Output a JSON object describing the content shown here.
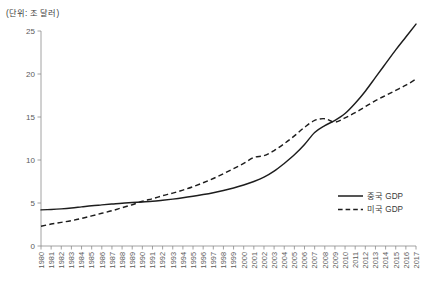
{
  "chart_data": {
    "type": "line",
    "title": "(단위: 조 달러)",
    "xlabel": "",
    "ylabel": "",
    "ylim": [
      0,
      25
    ],
    "yticks": [
      0,
      5,
      10,
      15,
      20,
      25
    ],
    "grid": false,
    "legend_position": "bottom-right",
    "x": [
      1980,
      1981,
      1982,
      1983,
      1984,
      1985,
      1986,
      1987,
      1988,
      1989,
      1990,
      1991,
      1992,
      1993,
      1994,
      1995,
      1996,
      1997,
      1998,
      1999,
      2000,
      2001,
      2002,
      2003,
      2004,
      2005,
      2006,
      2007,
      2008,
      2009,
      2010,
      2011,
      2012,
      2013,
      2014,
      2015,
      2016,
      2017
    ],
    "categories": [
      "1980",
      "1981",
      "1982",
      "1983",
      "1984",
      "1985",
      "1986",
      "1987",
      "1988",
      "1989",
      "1990",
      "1991",
      "1992",
      "1993",
      "1994",
      "1995",
      "1996",
      "1997",
      "1998",
      "1999",
      "2000",
      "2001",
      "2002",
      "2003",
      "2004",
      "2005",
      "2006",
      "2007",
      "2008",
      "2009",
      "2010",
      "2011",
      "2012",
      "2013",
      "2014",
      "2015",
      "2016",
      "2017"
    ],
    "series": [
      {
        "name": "중국 GDP",
        "style": "solid",
        "color": "#1d1d1d",
        "values": [
          4.2,
          4.25,
          4.32,
          4.42,
          4.55,
          4.68,
          4.78,
          4.88,
          4.98,
          5.05,
          5.12,
          5.2,
          5.32,
          5.45,
          5.6,
          5.78,
          5.98,
          6.2,
          6.45,
          6.75,
          7.1,
          7.5,
          8.0,
          8.7,
          9.6,
          10.6,
          11.8,
          13.2,
          14.0,
          14.6,
          15.4,
          16.6,
          18.0,
          19.6,
          21.2,
          22.8,
          24.3,
          25.8
        ]
      },
      {
        "name": "미국 GDP",
        "style": "dashed",
        "color": "#1d1d1d",
        "values": [
          2.3,
          2.55,
          2.75,
          2.95,
          3.2,
          3.5,
          3.8,
          4.1,
          4.45,
          4.8,
          5.2,
          5.5,
          5.85,
          6.15,
          6.5,
          6.9,
          7.35,
          7.85,
          8.4,
          9.0,
          9.6,
          10.3,
          10.5,
          11.1,
          11.9,
          12.8,
          13.8,
          14.6,
          14.8,
          14.4,
          14.9,
          15.5,
          16.2,
          16.9,
          17.5,
          18.1,
          18.7,
          19.4
        ]
      }
    ]
  },
  "legend": {
    "items": [
      {
        "label": "중국 GDP",
        "style": "solid"
      },
      {
        "label": "미국 GDP",
        "style": "dashed"
      }
    ]
  }
}
